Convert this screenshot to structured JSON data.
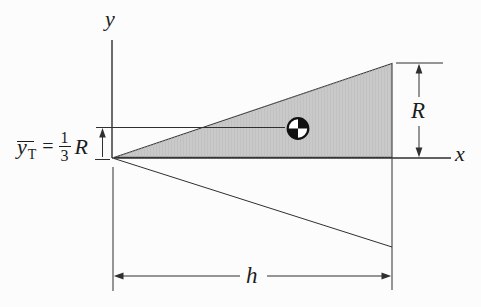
{
  "figure": {
    "axes": {
      "x_label": "x",
      "y_label": "y"
    },
    "dimensions": {
      "height_label": "R",
      "base_label": "h"
    },
    "centroid_formula": {
      "variable": "y",
      "subscript": "T",
      "equals": "=",
      "numerator": "1",
      "denominator": "3",
      "scale_symbol": "R"
    },
    "icons": {
      "centroid_symbol": "quartered-circle-centroid-icon"
    },
    "colors": {
      "triangle_fill": "#c9c9c9",
      "line": "#2f2f2f",
      "symbol_black": "#111111",
      "background": "#fcfcfc"
    }
  }
}
